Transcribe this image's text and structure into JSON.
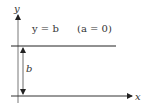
{
  "diagram": {
    "axes": {
      "x_label": "x",
      "y_label": "y"
    },
    "line_label": "y = b",
    "condition_label": "(a = 0)",
    "distance_label": "b",
    "colors": {
      "line": "#222222",
      "text": "#333333",
      "background": "#ffffff"
    }
  }
}
